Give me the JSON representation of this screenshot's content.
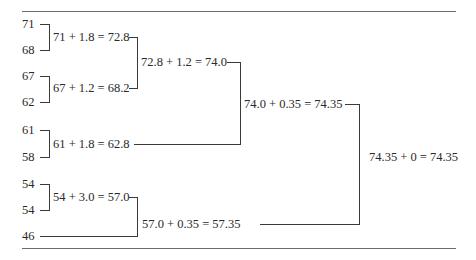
{
  "diagram": {
    "type": "tree-aggregation",
    "leaves": [
      "71",
      "68",
      "67",
      "62",
      "61",
      "58",
      "54",
      "54",
      "46"
    ],
    "nodes": {
      "n1": "71 + 1.8 = 72.8",
      "n2": "67 + 1.2 = 68.2",
      "n3": "61 + 1.8 = 62.8",
      "n4": "54 + 3.0 = 57.0",
      "n5": "72.8 + 1.2 = 74.0",
      "n6": "74.0 + 0.35 = 74.35",
      "n7": "57.0 + 0.35 = 57.35",
      "root": "74.35 + 0 = 74.35"
    }
  }
}
